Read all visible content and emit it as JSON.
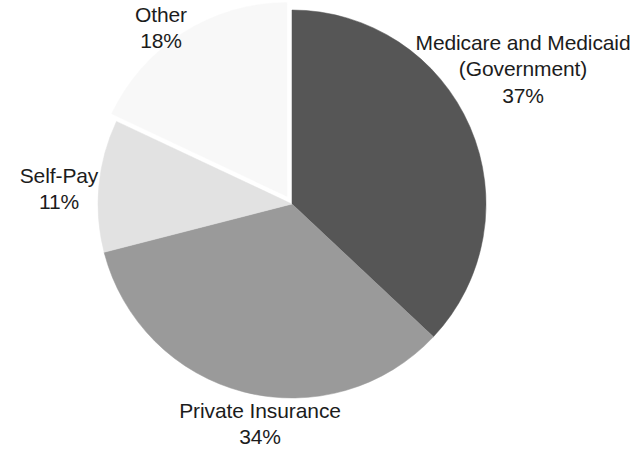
{
  "chart_data": {
    "type": "pie",
    "title": "",
    "subtitle": "",
    "xlabel": "",
    "ylabel": "",
    "legend_position": "none",
    "grid": false,
    "units": "percent",
    "start_angle_deg": 0,
    "direction": "clockwise",
    "categories": [
      "Medicare and Medicaid (Government)",
      "Private Insurance",
      "Self-Pay",
      "Other"
    ],
    "values": [
      37,
      34,
      11,
      18
    ],
    "slices": [
      {
        "label": "Medicare and Medicaid (Government)",
        "label_line_1": "Medicare and Medicaid",
        "label_line_2": "(Government)",
        "value": 37,
        "value_text": "37%",
        "color": "#565656",
        "start_deg": 0,
        "end_deg": 133.2,
        "exploded": false
      },
      {
        "label": "Private Insurance",
        "label_line_1": "Private Insurance",
        "label_line_2": "",
        "value": 34,
        "value_text": "34%",
        "color": "#9a9a9a",
        "start_deg": 133.2,
        "end_deg": 255.6,
        "exploded": false
      },
      {
        "label": "Self-Pay",
        "label_line_1": "Self-Pay",
        "label_line_2": "",
        "value": 11,
        "value_text": "11%",
        "color": "#e2e2e2",
        "start_deg": 255.6,
        "end_deg": 295.2,
        "exploded": false
      },
      {
        "label": "Other",
        "label_line_1": "Other",
        "label_line_2": "",
        "value": 18,
        "value_text": "18%",
        "color": "#f8f8f8",
        "start_deg": 295.2,
        "end_deg": 360,
        "exploded": true
      }
    ]
  },
  "labels": {
    "medicare": {
      "line1": "Medicare and Medicaid",
      "line2": "(Government)",
      "value": "37%"
    },
    "private_insurance": {
      "line1": "Private Insurance",
      "value": "34%"
    },
    "self_pay": {
      "line1": "Self-Pay",
      "value": "11%"
    },
    "other": {
      "line1": "Other",
      "value": "18%"
    }
  },
  "geometry": {
    "center_x": 292,
    "center_y": 204,
    "radius": 194,
    "explode_offset": 9,
    "explode_angle_deg": 327
  },
  "colors": {
    "background": "#ffffff",
    "text": "#1c1c1c",
    "slice_dark": "#565656",
    "slice_medium": "#9a9a9a",
    "slice_light": "#e2e2e2",
    "slice_lightest": "#f8f8f8"
  }
}
